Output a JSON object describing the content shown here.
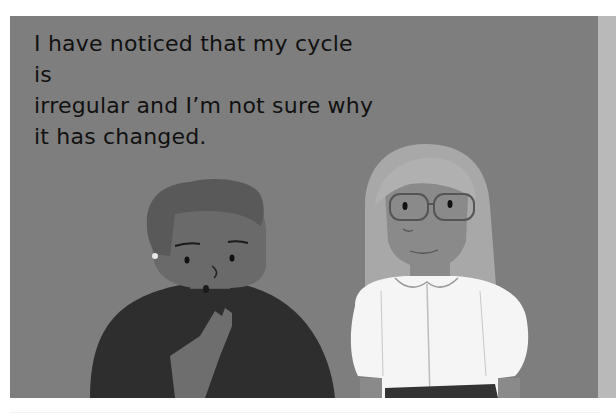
{
  "illustration": {
    "caption": "I have noticed that my cycle is irregular and I’m not sure why it has changed.",
    "caption_lines": [
      "I have noticed that my cycle is",
      "irregular and I’m not sure why",
      "it has changed."
    ],
    "characters": [
      {
        "name": "person-speaking",
        "description": "Person with short curly hair, earring, hand on chest, surprised expression, dark top"
      },
      {
        "name": "person-listening",
        "description": "Person with long light hair, glasses, white puffed-sleeve blouse with collar, dark skirt"
      }
    ],
    "colors": {
      "background": "#7e7e7e",
      "border": "#ffffff",
      "side_strip": "#b9b9b9",
      "text": "#111111"
    }
  }
}
